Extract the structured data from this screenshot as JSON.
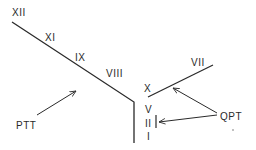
{
  "diagram": {
    "labels": {
      "xii": "XII",
      "xi": "XI",
      "ix": "IX",
      "viii": "VIII",
      "x": "X",
      "vii": "VII",
      "v": "V",
      "ii": "II",
      "i": "I",
      "ptt": "PTT",
      "qpt": "QPT"
    },
    "colors": {
      "line": "#2a2a2a",
      "background": "#ffffff"
    }
  }
}
